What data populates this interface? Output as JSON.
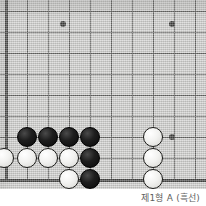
{
  "figure": {
    "kind": "go-board-corner-diagram",
    "caption": "제1형 A (흑선)"
  },
  "board": {
    "background_color": "#c9c9c7",
    "line_color": "#4a4a48",
    "edge_color": "#242422",
    "cell_size_px": 21,
    "origin_x_px": 6,
    "origin_y_px": -10,
    "columns_visible": 10,
    "rows_visible": 10,
    "edges": {
      "left": true,
      "bottom": true,
      "top": false,
      "right": false
    },
    "vertical_lines_x": [
      6,
      27,
      48,
      69,
      90,
      111,
      132,
      153,
      174,
      195
    ],
    "horizontal_lines_y": [
      11,
      32,
      53,
      74,
      95,
      116,
      137,
      158,
      179
    ],
    "left_edge_x": 6,
    "bottom_edge_y": 179
  },
  "star_points": {
    "color": "#1a1a18",
    "points": [
      {
        "name": "hoshi-upper-left",
        "x": 63,
        "y": 24
      },
      {
        "name": "hoshi-upper-right",
        "x": 172,
        "y": 24
      },
      {
        "name": "hoshi-lower-right",
        "x": 172,
        "y": 137
      }
    ]
  },
  "stones": {
    "diameter_px": 20,
    "black_color": "#141414",
    "white_color": "#f4f4f2",
    "items": [
      {
        "color": "black",
        "x": 27,
        "y": 137
      },
      {
        "color": "black",
        "x": 48,
        "y": 137
      },
      {
        "color": "black",
        "x": 69,
        "y": 137
      },
      {
        "color": "black",
        "x": 90,
        "y": 137
      },
      {
        "color": "white",
        "x": 4,
        "y": 158
      },
      {
        "color": "white",
        "x": 27,
        "y": 158
      },
      {
        "color": "white",
        "x": 48,
        "y": 158
      },
      {
        "color": "white",
        "x": 69,
        "y": 158
      },
      {
        "color": "black",
        "x": 90,
        "y": 158
      },
      {
        "color": "white",
        "x": 69,
        "y": 179
      },
      {
        "color": "black",
        "x": 90,
        "y": 179
      },
      {
        "color": "white",
        "x": 153,
        "y": 137
      },
      {
        "color": "white",
        "x": 153,
        "y": 158
      },
      {
        "color": "white",
        "x": 153,
        "y": 179
      }
    ]
  }
}
